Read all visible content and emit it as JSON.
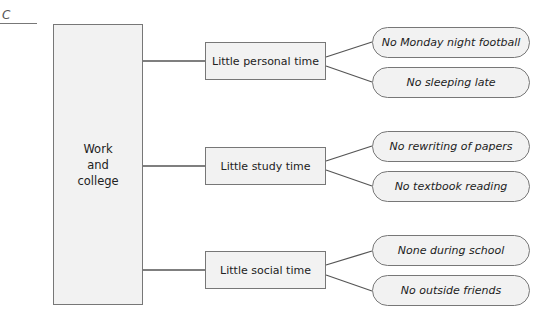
{
  "figure_label": "C",
  "root": {
    "lines": [
      "Work",
      "and",
      "college"
    ]
  },
  "branches": [
    {
      "label": "Little personal time",
      "leaves": [
        "No Monday night football",
        "No sleeping late"
      ]
    },
    {
      "label": "Little study time",
      "leaves": [
        "No rewriting of papers",
        "No textbook reading"
      ]
    },
    {
      "label": "Little social time",
      "leaves": [
        "None during school",
        "No outside friends"
      ]
    }
  ],
  "colors": {
    "box_fill": "#f2f2f2",
    "stroke": "#777777",
    "text": "#222222"
  }
}
